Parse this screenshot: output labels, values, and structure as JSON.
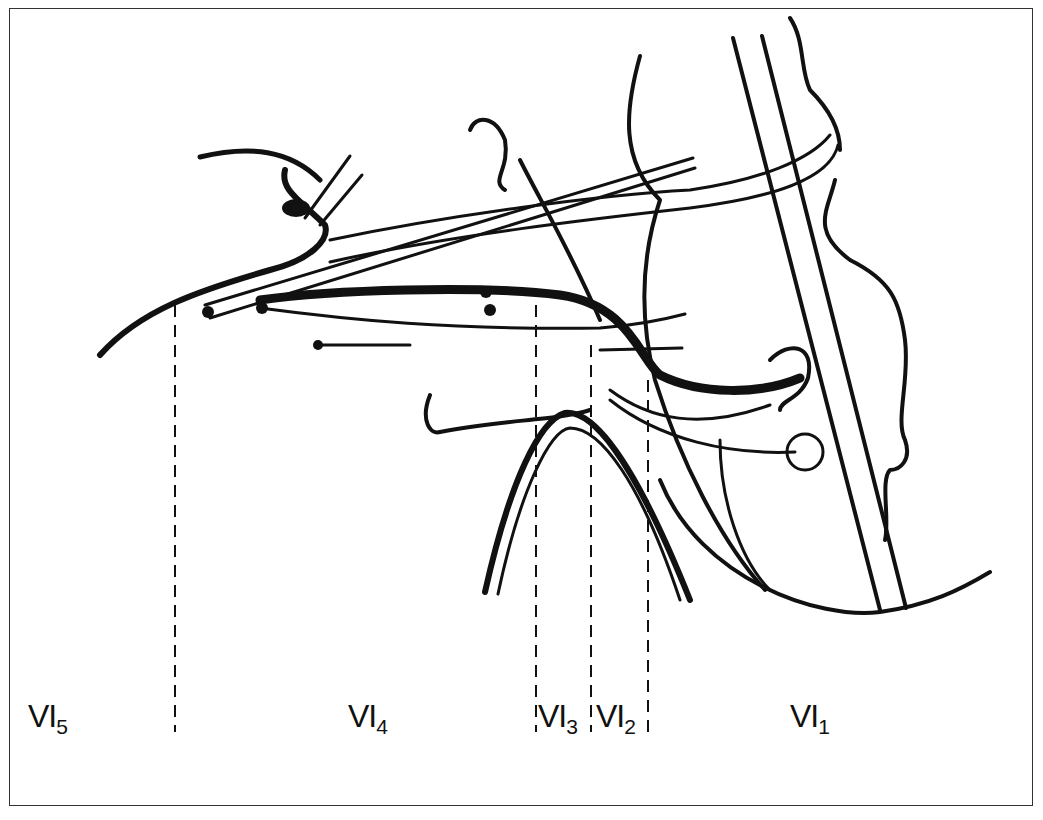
{
  "figure": {
    "type": "anatomical line diagram",
    "frame": true,
    "stroke_color": "#111111",
    "background": "#ffffff"
  },
  "zones": [
    {
      "id": "VI5",
      "base": "VI",
      "sub": "5",
      "x": 28
    },
    {
      "id": "VI4",
      "base": "VI",
      "sub": "4",
      "x": 348
    },
    {
      "id": "VI3",
      "base": "VI",
      "sub": "3",
      "x": 538
    },
    {
      "id": "VI2",
      "base": "VI",
      "sub": "2",
      "x": 596
    },
    {
      "id": "VI1",
      "base": "VI",
      "sub": "1",
      "x": 790
    }
  ],
  "dividers": [
    {
      "x": 175,
      "y1": 305,
      "y2": 732
    },
    {
      "x": 536,
      "y1": 305,
      "y2": 732
    },
    {
      "x": 591,
      "y1": 345,
      "y2": 732
    },
    {
      "x": 648,
      "y1": 380,
      "y2": 732
    }
  ]
}
